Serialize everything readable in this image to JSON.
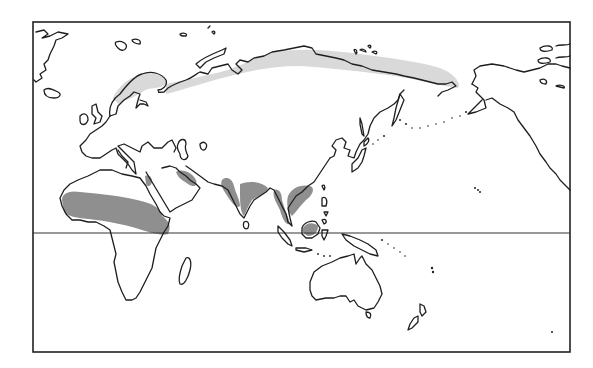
{
  "map": {
    "type": "world-map-pacific-centered",
    "frame": {
      "x": 33,
      "y": 22,
      "width": 537,
      "height": 330
    },
    "equator_line": {
      "y": 233,
      "visible": true
    },
    "legend": [],
    "regions": {
      "light_shading": {
        "color": "#d9d9d9",
        "areas": [
          "northern-scandinavia",
          "northern-siberia-band"
        ]
      },
      "dark_shading": {
        "color": "#8f8f8f",
        "areas": [
          "sahel-africa",
          "red-sea-coast",
          "iran-south-coast",
          "indus-valley",
          "india-ganges",
          "bay-of-bengal-coast",
          "burma-thailand",
          "south-china",
          "borneo"
        ]
      }
    },
    "landmasses": [
      "greenland",
      "iceland",
      "svalbard",
      "british-isles",
      "europe",
      "scandinavia",
      "russia-siberia",
      "africa",
      "madagascar",
      "arabia",
      "india",
      "sri-lanka",
      "southeast-asia",
      "china",
      "japan",
      "kamchatka",
      "alaska",
      "canadian-arctic-islands",
      "indonesia",
      "new-guinea",
      "australia",
      "tasmania",
      "new-zealand",
      "aleutian-islands",
      "hawaii"
    ]
  }
}
